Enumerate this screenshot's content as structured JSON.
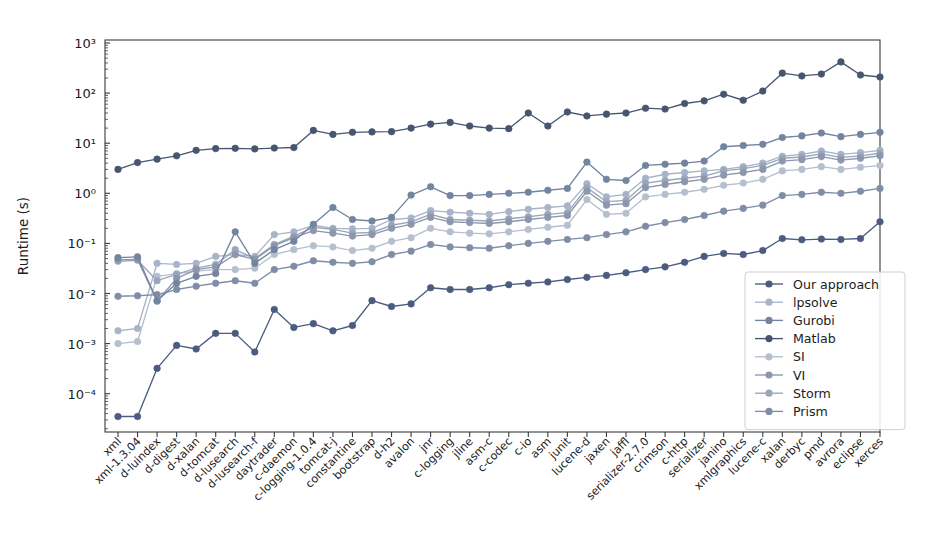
{
  "figure": {
    "background": "#ffffff",
    "width": 941,
    "height": 543
  },
  "chart_data": {
    "type": "line",
    "title": "",
    "xlabel": "",
    "ylabel": "Runtime (s)",
    "yscale": "log",
    "ylim": [
      2e-05,
      1500
    ],
    "ytick_labels": [
      "10³",
      "10²",
      "10¹",
      "10⁰",
      "10⁻¹",
      "10⁻²",
      "10⁻³",
      "10⁻⁴"
    ],
    "ytick_values": [
      1000,
      100,
      10,
      1,
      0.1,
      0.01,
      0.001,
      0.0001
    ],
    "grid": false,
    "legend_position": "lower right",
    "categories": [
      "xml",
      "xml-1.3.04",
      "d-luindex",
      "d-digest",
      "d-xalan",
      "d-tomcat",
      "d-lusearch",
      "d-lusearch-f",
      "daytrader",
      "c-daemon",
      "c-logging-1.0.4",
      "tomcat-j",
      "constantine",
      "bootstrap",
      "d-h2",
      "avalon",
      "jnr",
      "c-logging",
      "jline",
      "asm-c",
      "c-codec",
      "c-io",
      "asm",
      "junit",
      "lucene-d",
      "jaxen",
      "jaffl",
      "serializer-2.7.0",
      "crimson",
      "c-http",
      "serializer",
      "janino",
      "xmlgraphics",
      "lucene-c",
      "xalan",
      "derbyc",
      "pmd",
      "avrora",
      "eclipse",
      "xerces"
    ],
    "series": [
      {
        "name": "Our approach",
        "color": "#4c5c80",
        "values": [
          3.5e-05,
          3.5e-05,
          0.00032,
          0.00092,
          0.00078,
          0.0016,
          0.0016,
          0.00068,
          0.0048,
          0.0021,
          0.0025,
          0.0018,
          0.0023,
          0.0072,
          0.0055,
          0.0062,
          0.013,
          0.012,
          0.012,
          0.013,
          0.015,
          0.016,
          0.017,
          0.019,
          0.021,
          0.023,
          0.026,
          0.03,
          0.034,
          0.042,
          0.055,
          0.063,
          0.06,
          0.072,
          0.125,
          0.118,
          0.122,
          0.12,
          0.125,
          0.27
        ]
      },
      {
        "name": "lpsolve",
        "color": "#a8b4c8",
        "values": [
          0.0018,
          0.002,
          0.04,
          0.038,
          0.04,
          0.055,
          0.06,
          0.055,
          0.15,
          0.17,
          0.23,
          0.2,
          0.195,
          0.2,
          0.3,
          0.32,
          0.45,
          0.42,
          0.4,
          0.38,
          0.43,
          0.48,
          0.52,
          0.56,
          1.55,
          0.85,
          0.95,
          2.0,
          2.4,
          2.6,
          2.8,
          3.0,
          3.4,
          4.0,
          5.5,
          6.0,
          7.0,
          6.0,
          6.5,
          7.2
        ]
      },
      {
        "name": "Gurobi",
        "color": "#7284a0",
        "values": [
          0.052,
          0.054,
          0.0072,
          0.016,
          0.022,
          0.025,
          0.17,
          0.04,
          0.075,
          0.11,
          0.24,
          0.52,
          0.3,
          0.28,
          0.33,
          0.92,
          1.35,
          0.9,
          0.9,
          0.95,
          1.0,
          1.05,
          1.15,
          1.25,
          4.2,
          1.9,
          1.8,
          3.6,
          3.8,
          4.0,
          4.4,
          8.5,
          9.0,
          9.5,
          13.0,
          14.0,
          16.0,
          13.5,
          15.0,
          16.5
        ]
      },
      {
        "name": "Matlab",
        "color": "#47566f",
        "values": [
          3.0,
          4.1,
          4.8,
          5.6,
          7.2,
          7.8,
          7.9,
          7.7,
          8.0,
          8.2,
          18.0,
          15.0,
          16.5,
          16.8,
          17.0,
          20.0,
          24.0,
          26.0,
          22.0,
          20.0,
          19.5,
          40.0,
          22.0,
          42.0,
          35.0,
          38.0,
          40.0,
          50.0,
          48.0,
          62.0,
          70.0,
          95.0,
          72.0,
          110.0,
          250.0,
          220.0,
          240.0,
          420.0,
          230.0,
          210.0
        ]
      },
      {
        "name": "SI",
        "color": "#b6bfce"
      },
      {
        "name": "VI",
        "color": "#8c97ad"
      },
      {
        "name": "Storm",
        "color": "#9aa6ba"
      },
      {
        "name": "Prism",
        "color": "#808da6"
      }
    ],
    "series_extra_values": {
      "SI": [
        0.001,
        0.0011,
        0.022,
        0.025,
        0.028,
        0.03,
        0.03,
        0.032,
        0.06,
        0.075,
        0.09,
        0.085,
        0.072,
        0.08,
        0.11,
        0.13,
        0.2,
        0.17,
        0.16,
        0.155,
        0.17,
        0.19,
        0.21,
        0.23,
        0.75,
        0.38,
        0.4,
        0.85,
        0.95,
        1.05,
        1.2,
        1.45,
        1.6,
        1.9,
        2.8,
        3.0,
        3.4,
        3.0,
        3.3,
        3.6
      ],
      "VI": [
        0.047,
        0.048,
        0.007,
        0.02,
        0.03,
        0.034,
        0.06,
        0.048,
        0.09,
        0.13,
        0.18,
        0.16,
        0.14,
        0.15,
        0.2,
        0.24,
        0.33,
        0.27,
        0.26,
        0.25,
        0.27,
        0.3,
        0.33,
        0.36,
        1.1,
        0.58,
        0.62,
        1.3,
        1.5,
        1.7,
        1.9,
        2.3,
        2.6,
        3.0,
        4.4,
        4.7,
        5.4,
        4.6,
        5.0,
        5.6
      ],
      "Storm": [
        0.044,
        0.046,
        0.018,
        0.024,
        0.032,
        0.038,
        0.075,
        0.05,
        0.095,
        0.14,
        0.21,
        0.19,
        0.16,
        0.165,
        0.23,
        0.27,
        0.38,
        0.3,
        0.29,
        0.28,
        0.31,
        0.34,
        0.38,
        0.41,
        1.3,
        0.68,
        0.72,
        1.6,
        1.8,
        2.0,
        2.2,
        2.8,
        3.1,
        3.6,
        5.0,
        5.3,
        6.1,
        5.2,
        5.6,
        6.3
      ],
      "Prism": [
        0.0088,
        0.009,
        0.0095,
        0.012,
        0.014,
        0.016,
        0.018,
        0.016,
        0.03,
        0.035,
        0.045,
        0.042,
        0.04,
        0.043,
        0.06,
        0.07,
        0.095,
        0.085,
        0.082,
        0.08,
        0.09,
        0.1,
        0.11,
        0.12,
        0.13,
        0.15,
        0.17,
        0.22,
        0.26,
        0.3,
        0.36,
        0.44,
        0.5,
        0.58,
        0.9,
        0.95,
        1.05,
        1.0,
        1.1,
        1.25
      ]
    },
    "legend_entries": [
      "Our approach",
      "lpsolve",
      "Gurobi",
      "Matlab",
      "SI",
      "VI",
      "Storm",
      "Prism"
    ]
  }
}
